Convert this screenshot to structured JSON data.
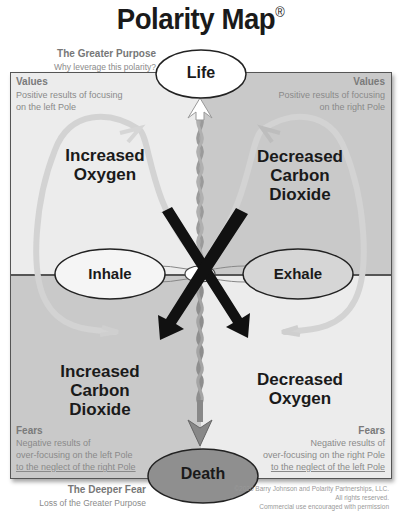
{
  "header": {
    "title": "Polarity Map",
    "registered_mark": "®"
  },
  "greater_purpose": {
    "title": "The Greater Purpose",
    "subtitle": "Why leverage this polarity?",
    "label": "Life"
  },
  "deeper_fear": {
    "title": "The Deeper Fear",
    "subtitle": "Loss of the Greater Purpose",
    "label": "Death"
  },
  "poles": {
    "left": "Inhale",
    "right": "Exhale"
  },
  "quadrants": {
    "top_left": {
      "heading": "Values",
      "description_line1": "Positive results of focusing",
      "description_line2": "on the left Pole",
      "content_line1": "Increased",
      "content_line2": "Oxygen"
    },
    "top_right": {
      "heading": "Values",
      "description_line1": "Positive results of focusing",
      "description_line2": "on the right Pole",
      "content_line1": "Decreased",
      "content_line2": "Carbon",
      "content_line3": "Dioxide"
    },
    "bottom_left": {
      "heading": "Fears",
      "description_line1": "Negative results of",
      "description_line2": "over-focusing on the left Pole",
      "description_line3": "to the neglect of the right Pole",
      "content_line1": "Increased",
      "content_line2": "Carbon",
      "content_line3": "Dioxide"
    },
    "bottom_right": {
      "heading": "Fears",
      "description_line1": "Negative results of",
      "description_line2": "over-focusing on the right Pole",
      "description_line3": "to the neglect of the left Pole",
      "content_line1": "Decreased",
      "content_line2": "Oxygen"
    }
  },
  "copyright": {
    "line1": "©2020 Barry Johnson and Polarity Partnerships, LLC.",
    "line2": "All rights reserved.",
    "line3": "Commercial use encouraged with permission"
  },
  "colors": {
    "light_quadrant": "#ececec",
    "dark_quadrant": "#c9c9c9",
    "x_arrows": "#111111",
    "loop_arrows": "#d4d4d4",
    "death_fill": "#8f8f8f"
  }
}
